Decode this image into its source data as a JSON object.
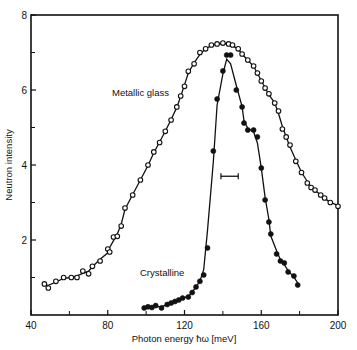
{
  "chart_data": {
    "type": "line",
    "title": "",
    "xlabel": "Photon energy ħω [meV]",
    "ylabel": "Neutron intensity",
    "xlim": [
      40,
      200
    ],
    "ylim": [
      0,
      8
    ],
    "x_ticks": [
      40,
      80,
      120,
      160,
      200
    ],
    "x_minor_ticks": [
      60,
      100,
      140,
      180
    ],
    "y_ticks": [
      2,
      4,
      6,
      8
    ],
    "y_minor_ticks": [
      1,
      3,
      5,
      7
    ],
    "grid": false,
    "legend": "inline annotations",
    "series": [
      {
        "name": "Metallic glass",
        "marker": "open-circle",
        "label_pos": [
          88,
          5.9
        ],
        "x": [
          47,
          49,
          53,
          57,
          61,
          64,
          67,
          70,
          72,
          76,
          80,
          81,
          83,
          85,
          87,
          89,
          93,
          97,
          101,
          104,
          107,
          110,
          113,
          116,
          118,
          120,
          122,
          125,
          128,
          131,
          134,
          137,
          140,
          143,
          145,
          148,
          150,
          153,
          156,
          158,
          160,
          162,
          164,
          167,
          169,
          171,
          173,
          175,
          178,
          181,
          184,
          186,
          188,
          191,
          193,
          196,
          200
        ],
        "values": [
          0.83,
          0.72,
          0.9,
          1.0,
          1.0,
          1.0,
          1.17,
          1.1,
          1.3,
          1.44,
          1.76,
          1.68,
          2.08,
          2.1,
          2.37,
          2.85,
          3.2,
          3.6,
          4.0,
          4.35,
          4.6,
          4.9,
          5.2,
          5.55,
          5.84,
          6.1,
          6.5,
          6.7,
          7.0,
          7.1,
          7.2,
          7.23,
          7.25,
          7.23,
          7.2,
          7.1,
          6.96,
          6.8,
          6.64,
          6.45,
          6.24,
          6.05,
          5.9,
          5.65,
          5.44,
          4.96,
          4.75,
          4.53,
          4.1,
          3.8,
          3.52,
          3.4,
          3.33,
          3.2,
          3.12,
          3.0,
          2.9
        ]
      },
      {
        "name": "Crystalline",
        "marker": "filled-circle",
        "label_pos": [
          102,
          1.2
        ],
        "x": [
          99,
          101,
          103,
          105,
          108,
          111,
          113,
          115,
          117,
          119,
          122,
          124,
          126,
          128,
          130,
          132,
          135,
          137,
          140,
          142,
          144,
          147,
          150,
          151,
          153,
          156,
          158,
          160,
          162,
          164,
          165,
          168,
          170,
          172,
          174,
          177,
          179
        ],
        "values": [
          0.19,
          0.22,
          0.2,
          0.25,
          0.19,
          0.28,
          0.32,
          0.36,
          0.4,
          0.45,
          0.48,
          0.6,
          0.75,
          0.9,
          1.07,
          1.79,
          4.37,
          5.76,
          6.51,
          6.93,
          6.93,
          6.0,
          5.55,
          5.12,
          4.93,
          4.93,
          4.75,
          3.92,
          3.07,
          2.48,
          2.16,
          1.63,
          1.44,
          1.39,
          1.15,
          1.04,
          0.8
        ]
      }
    ],
    "annotations": [
      {
        "type": "resolution-bar",
        "x_start": 139,
        "x_end": 148,
        "y": 3.7
      }
    ]
  },
  "labels": {
    "metallic": "Metallic glass",
    "crystalline": "Crystalline",
    "xlabel": "Photon energy ħω [meV]",
    "ylabel": "Neutron intensity"
  }
}
